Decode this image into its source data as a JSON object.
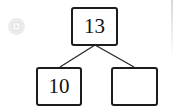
{
  "diagram": {
    "type": "number-bond",
    "title": "",
    "whole": {
      "label": "13",
      "empty": false
    },
    "parts": [
      {
        "label": "10",
        "empty": false
      },
      {
        "label": "",
        "empty": true
      }
    ],
    "edges": [
      {
        "from": "whole",
        "to": "part-left"
      },
      {
        "from": "whole",
        "to": "part-right"
      }
    ],
    "colors": {
      "box_border": "#1c1c1c",
      "box_fill": "#ffffff",
      "edge": "#2b2b2b",
      "text": "#111111",
      "badge": "#ececec",
      "background": "#ffffff"
    }
  },
  "badge": {
    "icon": "media-badge-icon",
    "label": ""
  }
}
